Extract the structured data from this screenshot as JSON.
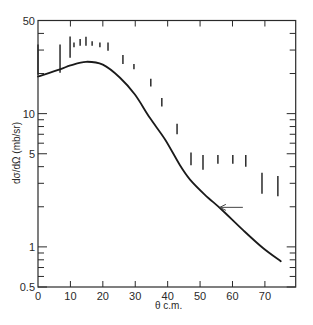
{
  "chart_data": {
    "type": "line",
    "title": "",
    "xlabel": "θ c.m.",
    "ylabel": "dσ/dΩ (mb/sr)",
    "xlim": [
      0,
      79.5
    ],
    "ylim": [
      0.5,
      50
    ],
    "yscale": "log",
    "grid": false,
    "legend": null,
    "x_ticks": [
      0,
      10,
      20,
      30,
      40,
      50,
      60,
      70
    ],
    "x_tick_labels": [
      "0",
      "10",
      "20",
      "30",
      "40",
      "50",
      "60",
      "70"
    ],
    "y_major_ticks": [
      0.5,
      1,
      5,
      10,
      50
    ],
    "y_tick_labels": [
      "0.5",
      "1",
      "5",
      "10",
      "50"
    ],
    "y_minor_ticks": [
      0.6,
      0.7,
      0.8,
      0.9,
      2,
      3,
      4,
      6,
      7,
      8,
      9,
      20,
      30,
      40
    ],
    "series": [
      {
        "name": "Calculated cross section",
        "kind": "line",
        "color": "#1a1a1a",
        "x": [
          0,
          6.8,
          10,
          14.8,
          20,
          25.3,
          29.9,
          34.5,
          39.2,
          43.8,
          46.9,
          51.5,
          56.7,
          63.2,
          69.4,
          74.9
        ],
        "y": [
          19.0,
          21.5,
          23.0,
          24.5,
          23.3,
          18.6,
          13.9,
          9.3,
          6.4,
          4.1,
          3.2,
          2.46,
          1.9,
          1.34,
          0.98,
          0.78
        ]
      },
      {
        "name": "Measured data (error bars)",
        "kind": "errorbar",
        "color": "#2a2a2a",
        "x": [
          0,
          6.8,
          9.9,
          11.1,
          13.0,
          14.8,
          16.7,
          19.1,
          21.6,
          26.2,
          29.6,
          34.8,
          38.2,
          42.9,
          47.2,
          50.9,
          55.5,
          60.1,
          64.1,
          69.1,
          74.0
        ],
        "low": [
          19.6,
          20.3,
          26.3,
          31.5,
          32.3,
          32.3,
          32.3,
          31.5,
          29.6,
          23.6,
          21.5,
          16.0,
          11.3,
          7.0,
          4.1,
          3.8,
          4.2,
          4.2,
          4.0,
          2.5,
          2.4
        ],
        "high": [
          33.0,
          33.0,
          37.9,
          34.2,
          36.3,
          37.7,
          35.0,
          34.2,
          34.2,
          27.6,
          23.6,
          18.3,
          13.1,
          8.4,
          5.1,
          4.9,
          4.9,
          4.9,
          4.9,
          3.6,
          3.4
        ]
      }
    ],
    "annotations": [
      {
        "type": "arrow",
        "from": [
          63.2,
          1.98
        ],
        "to": [
          56.1,
          1.98
        ],
        "text": ""
      }
    ]
  }
}
